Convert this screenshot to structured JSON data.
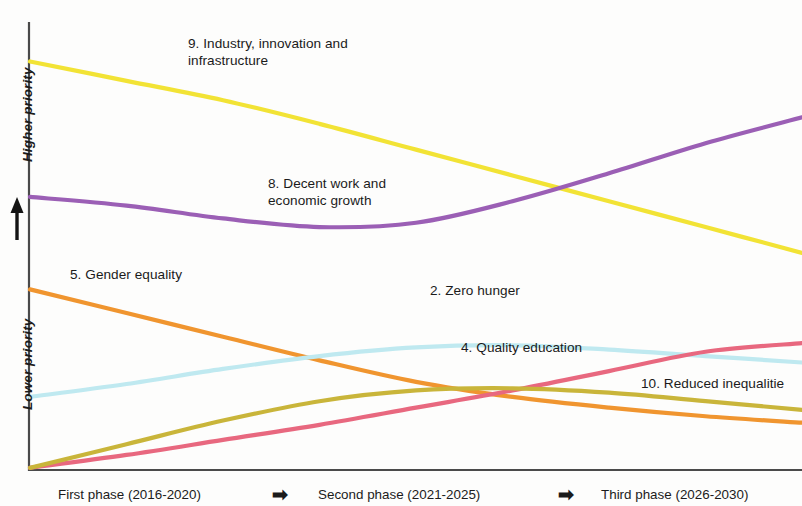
{
  "chart_data": {
    "type": "line",
    "title": "",
    "subtitle": "",
    "xlabel": "",
    "ylabel": "Priority",
    "grid": false,
    "legend_position": "inline-labels",
    "x_categories": [
      "First phase (2016-2020)",
      "Second phase (2021-2025)",
      "Third phase (2026-2030)"
    ],
    "y_axis": {
      "top_label": "Higher priority",
      "bottom_label": "Lower priority",
      "direction_arrow": "up",
      "ticks": [],
      "ylim": [
        0,
        100
      ],
      "note": "Qualitative ordinal axis; no numeric ticks shown"
    },
    "x": [
      0,
      12.5,
      25,
      37.5,
      50,
      62.5,
      75,
      87.5,
      100
    ],
    "series": [
      {
        "name": "9. Industry, innovation and infrastructure",
        "label": "9. Industry, innovation and\ninfrastructure",
        "color": "#f2e335",
        "values": [
          95,
          90.5,
          86,
          80.5,
          74.5,
          68.5,
          62.5,
          56.5,
          50.5
        ]
      },
      {
        "name": "8. Decent work and economic growth",
        "label": "8. Decent work and\neconomic growth",
        "color": "#9b5fb5",
        "values": [
          63.5,
          61.5,
          58.5,
          56.5,
          57.5,
          62.5,
          69,
          76,
          82
        ]
      },
      {
        "name": "5. Gender equality",
        "label": "5. Gender equality",
        "color": "#f0952f",
        "values": [
          42,
          36.5,
          31,
          25.5,
          20.5,
          17,
          14.5,
          12.5,
          11
        ]
      },
      {
        "name": "2. Zero hunger",
        "label": "2. Zero hunger",
        "color": "#bfe9f0",
        "values": [
          17,
          20,
          23.5,
          26.5,
          28.5,
          29,
          28,
          26.5,
          25
        ]
      },
      {
        "name": "4. Quality education",
        "label": "4. Quality education",
        "color": "#e8687f",
        "values": [
          0.5,
          3.5,
          7,
          10.5,
          14.5,
          18.5,
          23,
          27.5,
          29.5
        ]
      },
      {
        "name": "10. Reduced inequalities",
        "label": "10. Reduced inequalitie",
        "color": "#c9b53a",
        "values": [
          0.5,
          6,
          11.5,
          16,
          18.5,
          19,
          18,
          16,
          14
        ]
      }
    ]
  },
  "axis": {
    "higher_priority": "Higher priority",
    "lower_priority": "Lower priority",
    "arrow_icon": "up-arrow-icon"
  },
  "labels": {
    "sdg9": "9. Industry, innovation and\ninfrastructure",
    "sdg8": "8. Decent work and\neconomic growth",
    "sdg5": "5. Gender equality",
    "sdg2": "2. Zero hunger",
    "sdg4": "4. Quality education",
    "sdg10": "10. Reduced inequalitie"
  },
  "phases": {
    "first": "First phase (2016-2020)",
    "second": "Second phase (2021-2025)",
    "third": "Third phase (2026-2030)",
    "arrow": "➡"
  },
  "colors": {
    "sdg9": "#f2e335",
    "sdg8": "#9b5fb5",
    "sdg5": "#f0952f",
    "sdg2": "#bfe9f0",
    "sdg4": "#e8687f",
    "sdg10": "#c9b53a",
    "axis": "#4a4a4a",
    "text": "#1b1b1b",
    "background": "#fdfdfc"
  }
}
